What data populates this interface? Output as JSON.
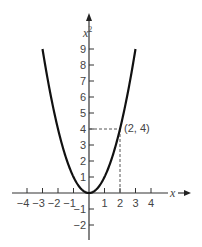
{
  "chart_data": {
    "type": "line",
    "title": "",
    "xlabel": "x",
    "ylabel": "x²",
    "xlim": [
      -4.5,
      4.5
    ],
    "ylim": [
      -3,
      10
    ],
    "grid": false,
    "legend": null,
    "x_ticks": [
      -4,
      -3,
      -2,
      -1,
      1,
      2,
      3,
      4
    ],
    "x_tick_labels": [
      "−4",
      "−3",
      "−2",
      "−1",
      "1",
      "2",
      "3",
      "4"
    ],
    "y_ticks": [
      -2,
      -1,
      1,
      2,
      3,
      4,
      5,
      6,
      7,
      8,
      9
    ],
    "y_tick_labels": [
      "−2",
      "−1",
      "1",
      "2",
      "3",
      "4",
      "5",
      "6",
      "7",
      "8",
      "9"
    ],
    "series": [
      {
        "name": "y = x²",
        "function": "x^2",
        "x": [
          -3,
          -2.5,
          -2,
          -1.5,
          -1,
          -0.5,
          0,
          0.5,
          1,
          1.5,
          2,
          2.5,
          3
        ],
        "values": [
          9,
          6.25,
          4,
          2.25,
          1,
          0.25,
          0,
          0.25,
          1,
          2.25,
          4,
          6.25,
          9
        ]
      }
    ],
    "annotations": [
      {
        "text": "(2, 4)",
        "point": [
          2,
          4
        ],
        "guide_lines": "dashed from point to both axes"
      }
    ]
  },
  "labels": {
    "x_axis": "x",
    "y_axis": "x",
    "y_axis_sup": "2",
    "point_label": "(2, 4)"
  }
}
